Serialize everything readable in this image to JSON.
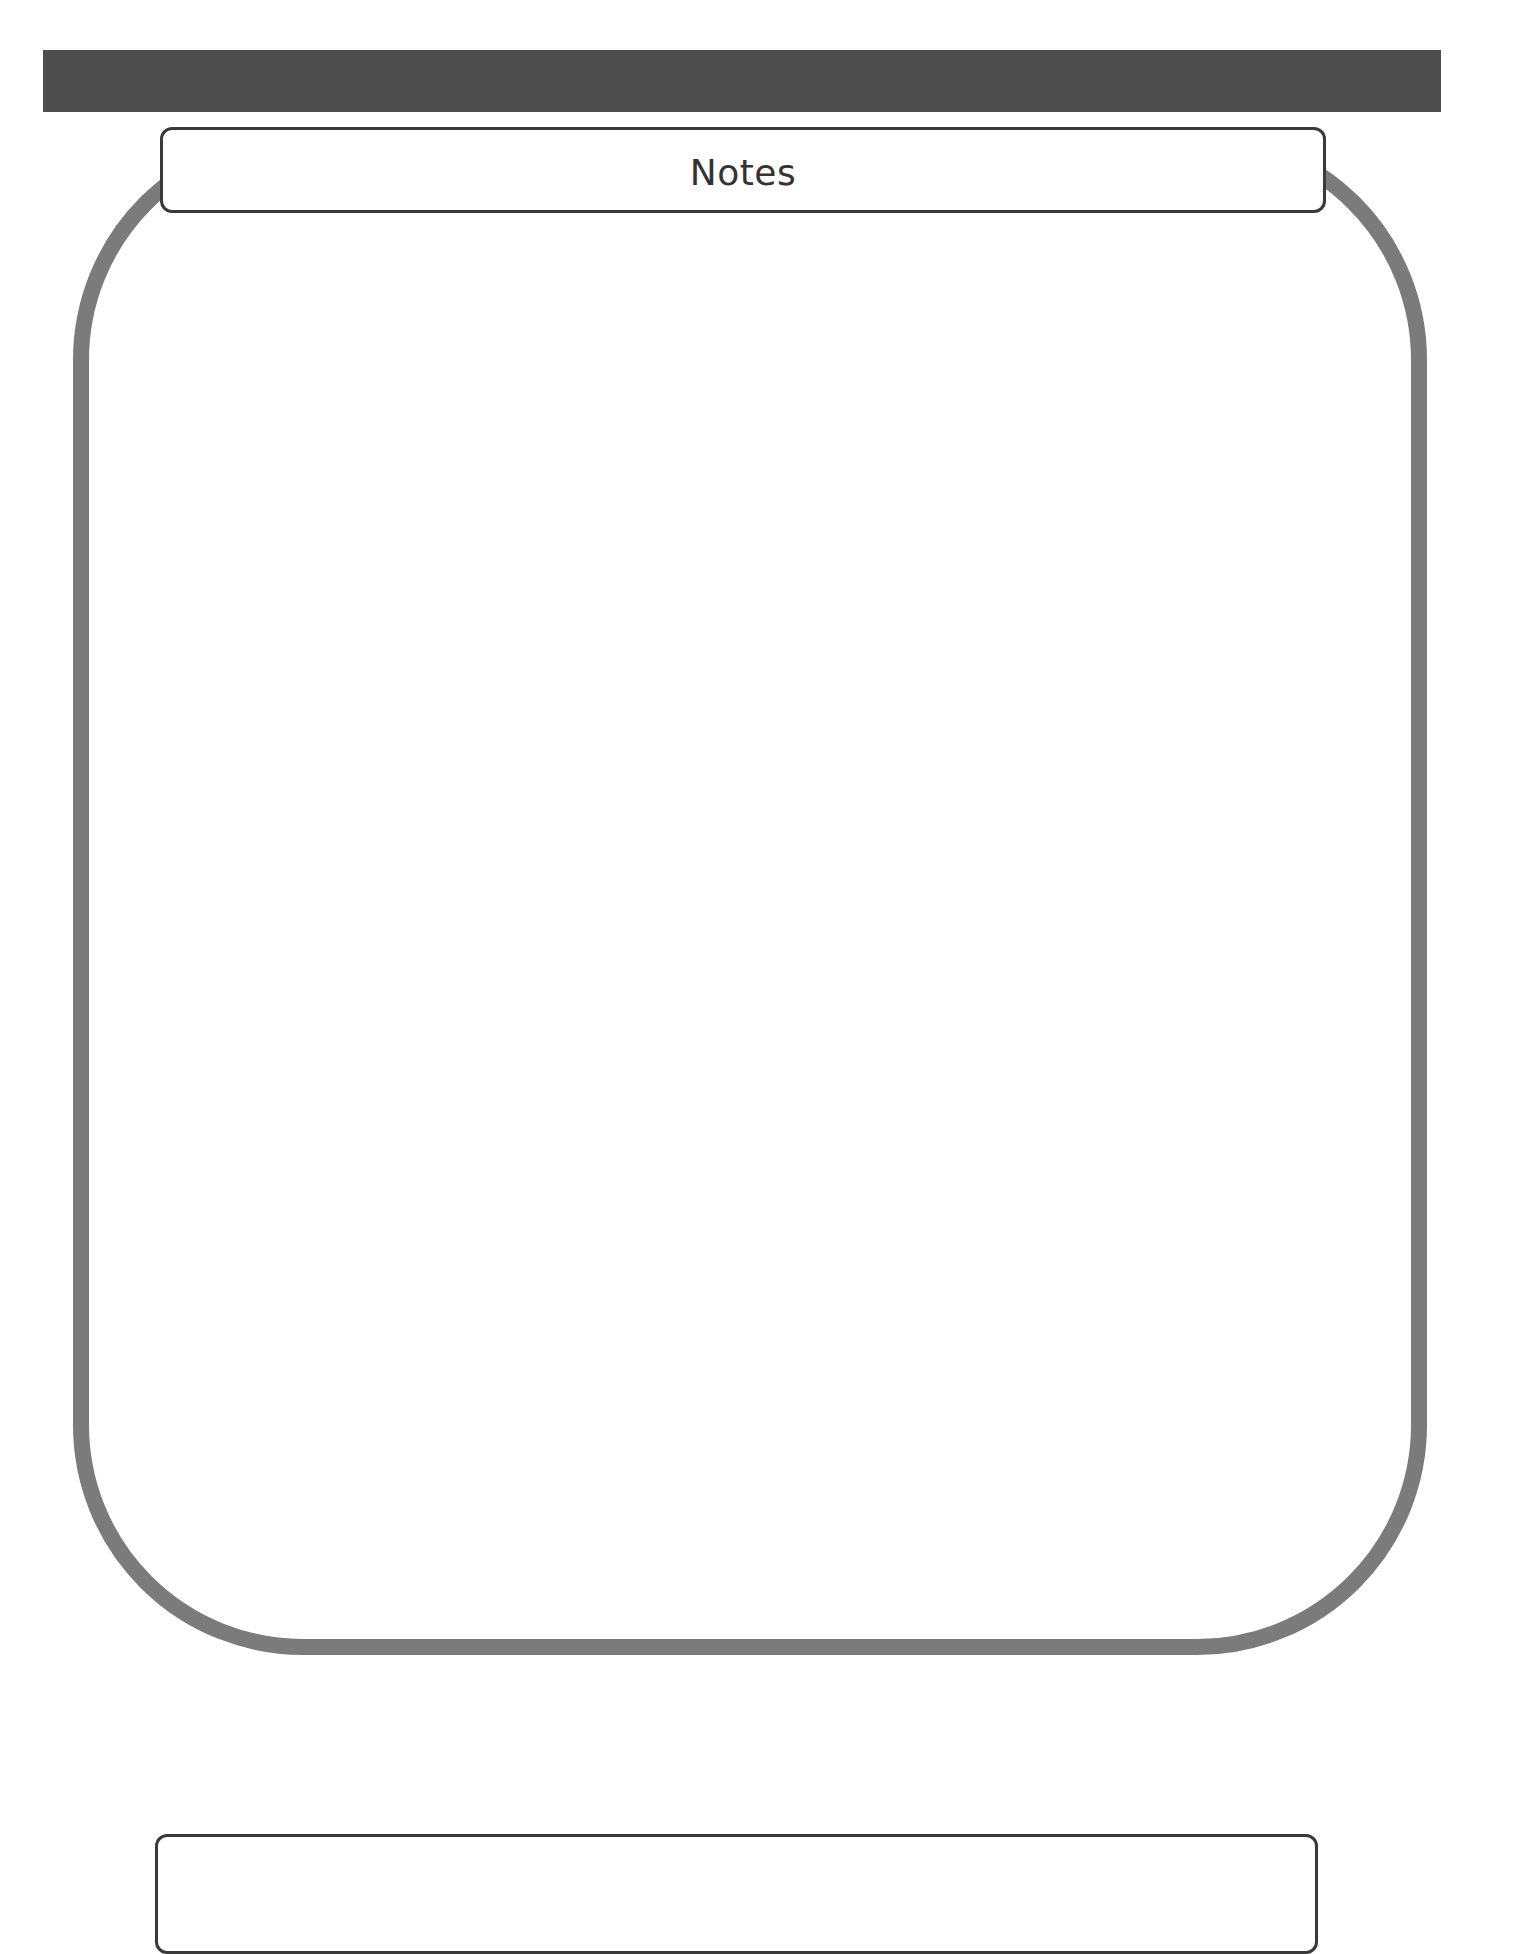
{
  "page": {
    "header_bar": {
      "color": "#4d4d4d"
    },
    "notes_section": {
      "title": "Notes",
      "frame_color": "#7b7b7b",
      "tab_border_color": "#3a3a3a",
      "content": ""
    },
    "bottom_box": {
      "content": ""
    }
  }
}
